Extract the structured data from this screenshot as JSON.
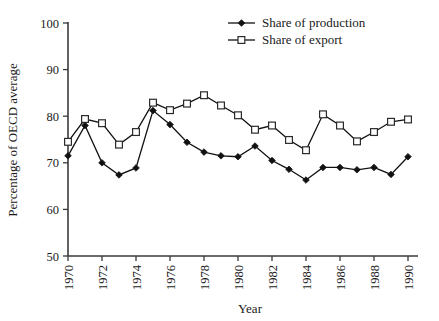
{
  "chart_data": {
    "type": "line",
    "title": "",
    "xlabel": "Year",
    "ylabel": "Percentage of OECD average",
    "xlim": [
      1970,
      1990
    ],
    "ylim": [
      50,
      100
    ],
    "xticks": [
      1970,
      1972,
      1974,
      1976,
      1978,
      1980,
      1982,
      1984,
      1986,
      1988,
      1990
    ],
    "xtick_labels": [
      "1970",
      "1972",
      "1974",
      "1976",
      "1978",
      "1980",
      "1982",
      "1984",
      "1986",
      "1988",
      "1990"
    ],
    "yticks": [
      50,
      60,
      70,
      80,
      90,
      100
    ],
    "ytick_labels": [
      "50",
      "60",
      "70",
      "80",
      "90",
      "100"
    ],
    "grid": false,
    "legend_position": "top-right",
    "x": [
      1970,
      1971,
      1972,
      1973,
      1974,
      1975,
      1976,
      1977,
      1978,
      1979,
      1980,
      1981,
      1982,
      1983,
      1984,
      1985,
      1986,
      1987,
      1988,
      1989,
      1990
    ],
    "series": [
      {
        "name": "Share of production",
        "marker": "filled-diamond",
        "values": [
          71.5,
          78.0,
          70.0,
          67.4,
          68.9,
          81.2,
          78.2,
          74.4,
          72.3,
          71.5,
          71.3,
          73.6,
          70.5,
          68.6,
          66.3,
          69.0,
          69.0,
          68.5,
          69.0,
          67.5,
          71.3
        ]
      },
      {
        "name": "Share of export",
        "marker": "open-square",
        "values": [
          74.5,
          79.4,
          78.5,
          73.9,
          76.6,
          82.9,
          81.3,
          82.7,
          84.5,
          82.3,
          80.2,
          77.1,
          78.0,
          74.9,
          72.7,
          80.4,
          78.0,
          74.6,
          76.6,
          78.8,
          79.3
        ]
      }
    ]
  },
  "legend": {
    "items": [
      {
        "label": "Share of production",
        "marker": "filled-diamond"
      },
      {
        "label": "Share of export",
        "marker": "open-square"
      }
    ]
  }
}
